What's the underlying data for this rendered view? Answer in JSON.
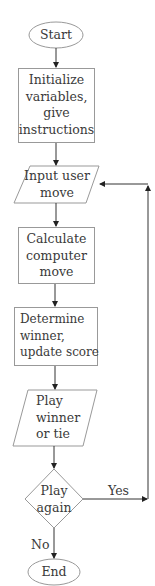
{
  "flowchart": {
    "title": "",
    "colors": {
      "stroke": "#888888",
      "arrow": "#222222",
      "text": "#3a3a3a",
      "background": "#ffffff"
    },
    "nodes": [
      {
        "id": "start",
        "shape": "ellipse",
        "label": "Start"
      },
      {
        "id": "init",
        "shape": "rectangle",
        "lines": [
          "Initialize",
          "variables,",
          "give",
          "instructions"
        ]
      },
      {
        "id": "input",
        "shape": "parallelogram",
        "lines": [
          "Input user",
          "move"
        ]
      },
      {
        "id": "calc",
        "shape": "rectangle",
        "lines": [
          "Calculate",
          "computer",
          "move"
        ]
      },
      {
        "id": "determine",
        "shape": "rectangle",
        "lines": [
          "Determine",
          "winner,",
          "update score"
        ]
      },
      {
        "id": "play",
        "shape": "parallelogram",
        "lines": [
          "Play",
          "winner",
          "or tie"
        ]
      },
      {
        "id": "again",
        "shape": "diamond",
        "lines": [
          "Play",
          "again"
        ]
      },
      {
        "id": "end",
        "shape": "ellipse",
        "label": "End"
      }
    ],
    "edges": [
      {
        "from": "start",
        "to": "init",
        "label": ""
      },
      {
        "from": "init",
        "to": "input",
        "label": ""
      },
      {
        "from": "input",
        "to": "calc",
        "label": ""
      },
      {
        "from": "calc",
        "to": "determine",
        "label": ""
      },
      {
        "from": "determine",
        "to": "play",
        "label": ""
      },
      {
        "from": "play",
        "to": "again",
        "label": ""
      },
      {
        "from": "again",
        "to": "input",
        "label": "Yes"
      },
      {
        "from": "again",
        "to": "end",
        "label": "No"
      }
    ],
    "edge_labels": {
      "yes": "Yes",
      "no": "No"
    }
  }
}
